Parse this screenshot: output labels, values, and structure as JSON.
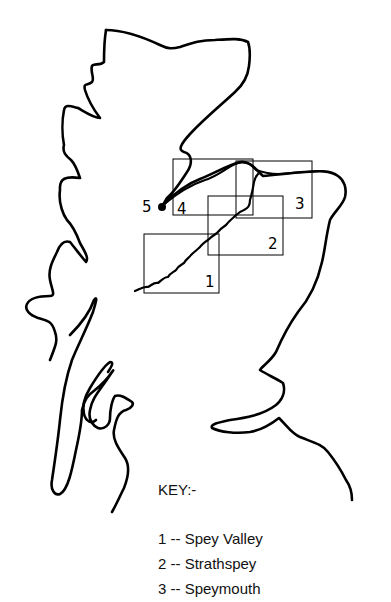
{
  "map": {
    "description": "Hand-drawn outline map of northern Scotland showing the River Spey and study area boxes",
    "regions": [
      {
        "number": "1"
      },
      {
        "number": "2"
      },
      {
        "number": "3"
      },
      {
        "number": "4"
      }
    ],
    "point_marker": {
      "number": "5"
    }
  },
  "key": {
    "heading": "KEY:-",
    "items": [
      {
        "number": "1",
        "label": "1 -- Spey Valley"
      },
      {
        "number": "2",
        "label": "2 -- Strathspey"
      },
      {
        "number": "3",
        "label": "3 -- Speymouth"
      }
    ]
  },
  "colors": {
    "ink": "#000000",
    "background": "#ffffff"
  }
}
